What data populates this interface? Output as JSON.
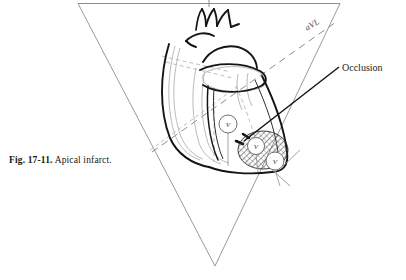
{
  "figure": {
    "caption_number": "Fig. 17-11.",
    "caption_text": "Apical infarct.",
    "caption_full": "Fig. 17-11. Apical infarct."
  },
  "labels": {
    "occlusion": "Occlusion",
    "axis_avl": "aVL"
  },
  "electrodes": [
    {
      "name": "precordial-lead-marker-1",
      "label": "V",
      "cx": 228,
      "cy": 124,
      "r": 9
    },
    {
      "name": "precordial-lead-marker-2",
      "label": "V",
      "cx": 256,
      "cy": 146,
      "r": 8.5
    },
    {
      "name": "precordial-lead-marker-3",
      "label": "V",
      "cx": 275,
      "cy": 161,
      "r": 9
    }
  ],
  "colors": {
    "ink": "#1a1a1a",
    "line_light": "#9a9a9a",
    "line_mid": "#6e6e6e",
    "hatch": "#3d3d3d",
    "page": "#ffffff"
  },
  "geometry": {
    "triangle_vertices": "78,3 340,3 215,266",
    "description": "Einthoven triangle enclosing an anterior view of the heart with an apical infarct"
  }
}
